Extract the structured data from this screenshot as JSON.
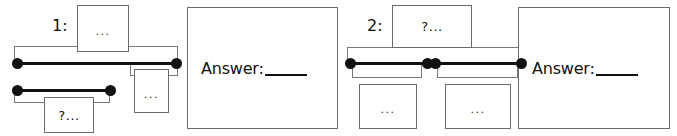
{
  "page": {
    "background_color": "#ffffff",
    "stroke_color": "#7a7a7a",
    "edge_color": "#111111",
    "text_color": "#111111"
  },
  "items": [
    {
      "index_label": "1:",
      "answer_label": "Answer:",
      "nodes": [
        {
          "name": "top-node",
          "text": "..."
        },
        {
          "name": "middle-node",
          "text": "..."
        },
        {
          "name": "question-node",
          "text": "?..."
        }
      ]
    },
    {
      "index_label": "2:",
      "answer_label": "Answer:",
      "nodes": [
        {
          "name": "top-node",
          "text": "?..."
        },
        {
          "name": "left-leaf-node",
          "text": "..."
        },
        {
          "name": "right-leaf-node",
          "text": "..."
        }
      ]
    }
  ]
}
